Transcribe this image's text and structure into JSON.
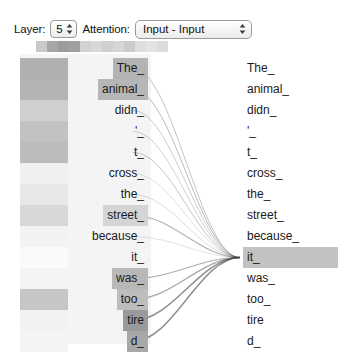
{
  "toolbar": {
    "layer_label": "Layer:",
    "layer_value": "5",
    "attention_label": "Attention:",
    "attention_value": "Input - Input",
    "stepper_icon": "stepper-updown-icon",
    "select_icon": "select-updown-icon"
  },
  "head_strip": {
    "name": "attention-head-selector",
    "count": 12,
    "cells": [
      {
        "index": 0,
        "color": "#c9c9c9"
      },
      {
        "index": 1,
        "color": "#a6a6a6"
      },
      {
        "index": 2,
        "color": "#9c9c9c"
      },
      {
        "index": 3,
        "color": "#a0a0a0"
      },
      {
        "index": 4,
        "color": "#d2d2d2"
      },
      {
        "index": 5,
        "color": "#d8d8d8"
      },
      {
        "index": 6,
        "color": "#cfcfcf"
      },
      {
        "index": 7,
        "color": "#d6d6d6"
      },
      {
        "index": 8,
        "color": "#cbcbcb"
      },
      {
        "index": 9,
        "color": "#dedede"
      },
      {
        "index": 10,
        "color": "#e3e3e3"
      },
      {
        "index": 11,
        "color": "#dcdcdc"
      }
    ]
  },
  "visualization": {
    "type": "attention-head-view",
    "selected_token_index": 9,
    "selected_token": "it_",
    "left_column": {
      "name": "source-token-column",
      "tokens": [
        {
          "index": 0,
          "text": "The_",
          "highlight": "#b3b3b3",
          "weight_color": "#b0b0b0"
        },
        {
          "index": 1,
          "text": "animal_",
          "highlight": "#b6b6b6",
          "weight_color": "#b4b4b4"
        },
        {
          "index": 2,
          "text": "didn_",
          "highlight": "#ffffff",
          "weight_color": "#cfcfcf"
        },
        {
          "index": 3,
          "text": "'_",
          "highlight": "#ffffff",
          "weight_color": "#c2c2c2"
        },
        {
          "index": 4,
          "text": "t_",
          "highlight": "#ffffff",
          "weight_color": "#bcbcbc"
        },
        {
          "index": 5,
          "text": "cross_",
          "highlight": "#ffffff",
          "weight_color": "#f0f0f0"
        },
        {
          "index": 6,
          "text": "the_",
          "highlight": "#ffffff",
          "weight_color": "#e8e8e8"
        },
        {
          "index": 7,
          "text": "street_",
          "highlight": "#d5d5d5",
          "weight_color": "#d8d8d8"
        },
        {
          "index": 8,
          "text": "because_",
          "highlight": "#ffffff",
          "weight_color": "#f2f2f2"
        },
        {
          "index": 9,
          "text": "it_",
          "highlight": "#ffffff",
          "weight_color": "#fafafa"
        },
        {
          "index": 10,
          "text": "was_",
          "highlight": "#b8b8b8",
          "weight_color": "#f4f4f4"
        },
        {
          "index": 11,
          "text": "too_",
          "highlight": "#bdbdbd",
          "weight_color": "#c6c6c6"
        },
        {
          "index": 12,
          "text": "tire",
          "highlight": "#9a9a9a",
          "weight_color": "#f2f2f2"
        },
        {
          "index": 13,
          "text": "d_",
          "highlight": "#a8a8a8",
          "weight_color": "#f4f4f4"
        }
      ]
    },
    "right_column": {
      "name": "target-token-column",
      "tokens": [
        {
          "index": 0,
          "text": "The_",
          "highlight": "transparent"
        },
        {
          "index": 1,
          "text": "animal_",
          "highlight": "transparent"
        },
        {
          "index": 2,
          "text": "didn_",
          "highlight": "transparent"
        },
        {
          "index": 3,
          "text": "'_",
          "highlight": "transparent"
        },
        {
          "index": 4,
          "text": "t_",
          "highlight": "transparent"
        },
        {
          "index": 5,
          "text": "cross_",
          "highlight": "transparent"
        },
        {
          "index": 6,
          "text": "the_",
          "highlight": "transparent"
        },
        {
          "index": 7,
          "text": "street_",
          "highlight": "transparent"
        },
        {
          "index": 8,
          "text": "because_",
          "highlight": "transparent"
        },
        {
          "index": 9,
          "text": "it_",
          "highlight": "#c2c2c2"
        },
        {
          "index": 10,
          "text": "was_",
          "highlight": "transparent"
        },
        {
          "index": 11,
          "text": "too_",
          "highlight": "transparent"
        },
        {
          "index": 12,
          "text": "tire",
          "highlight": "transparent"
        },
        {
          "index": 13,
          "text": "d_",
          "highlight": "transparent"
        }
      ]
    },
    "edges": [
      {
        "from": 0,
        "to": 9,
        "opacity": 0.3,
        "width": 1.0
      },
      {
        "from": 1,
        "to": 9,
        "opacity": 0.34,
        "width": 1.0
      },
      {
        "from": 2,
        "to": 9,
        "opacity": 0.26,
        "width": 1.0
      },
      {
        "from": 3,
        "to": 9,
        "opacity": 0.24,
        "width": 1.0
      },
      {
        "from": 4,
        "to": 9,
        "opacity": 0.3,
        "width": 1.0
      },
      {
        "from": 5,
        "to": 9,
        "opacity": 0.16,
        "width": 1.0
      },
      {
        "from": 6,
        "to": 9,
        "opacity": 0.18,
        "width": 1.0
      },
      {
        "from": 7,
        "to": 9,
        "opacity": 0.4,
        "width": 1.2
      },
      {
        "from": 8,
        "to": 9,
        "opacity": 0.14,
        "width": 1.0
      },
      {
        "from": 10,
        "to": 9,
        "opacity": 0.42,
        "width": 1.2
      },
      {
        "from": 11,
        "to": 9,
        "opacity": 0.46,
        "width": 1.3
      },
      {
        "from": 12,
        "to": 9,
        "opacity": 0.6,
        "width": 1.4
      },
      {
        "from": 13,
        "to": 9,
        "opacity": 0.58,
        "width": 1.4
      }
    ],
    "geometry": {
      "row_height": 21,
      "first_row_top": 4,
      "left_line_x": 133,
      "right_line_x": 240
    }
  }
}
